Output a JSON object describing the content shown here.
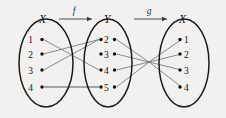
{
  "figure": {
    "background_color": "#f2f1ef",
    "line_color": "#6d6d6d",
    "outline_color": "#1c1c1c"
  },
  "sets": {
    "left": {
      "name": "X",
      "elements": [
        "1",
        "2",
        "3",
        "4"
      ]
    },
    "middle": {
      "name": "Y",
      "elements": [
        "2",
        "3",
        "4",
        "5"
      ]
    },
    "right": {
      "name": "X",
      "elements": [
        "1",
        "2",
        "3",
        "4"
      ]
    }
  },
  "maps": {
    "f": {
      "label": "f",
      "from": "X",
      "to": "Y",
      "pairs": [
        {
          "from": "1",
          "to": "4"
        },
        {
          "from": "2",
          "to": "2"
        },
        {
          "from": "3",
          "to": "2"
        },
        {
          "from": "4",
          "to": "5"
        }
      ]
    },
    "g": {
      "label": "g",
      "from": "Y",
      "to": "X",
      "pairs": [
        {
          "from": "2",
          "to": "3"
        },
        {
          "from": "3",
          "to": "2"
        },
        {
          "from": "4",
          "to": "1"
        },
        {
          "from": "5",
          "to": "4"
        }
      ]
    }
  }
}
